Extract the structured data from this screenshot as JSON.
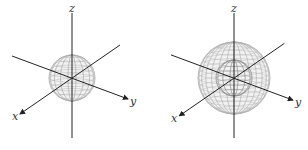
{
  "figures": [
    {
      "id": "left",
      "description": "single sphere wireframe centered at origin",
      "axes": {
        "x": "x",
        "y": "y",
        "z": "z"
      },
      "spheres": [
        {
          "relative_radius": 1.0,
          "shade": "#aaaaaa"
        }
      ]
    },
    {
      "id": "right",
      "description": "large sphere wireframe containing smaller inner sphere",
      "axes": {
        "x": "x",
        "y": "y",
        "z": "z"
      },
      "spheres": [
        {
          "relative_radius": 2.0,
          "shade": "#b0b0b0"
        },
        {
          "relative_radius": 1.0,
          "shade": "#888888"
        }
      ]
    }
  ],
  "colors": {
    "axis": "#222222",
    "wire": "#999999",
    "label": "#333333"
  }
}
